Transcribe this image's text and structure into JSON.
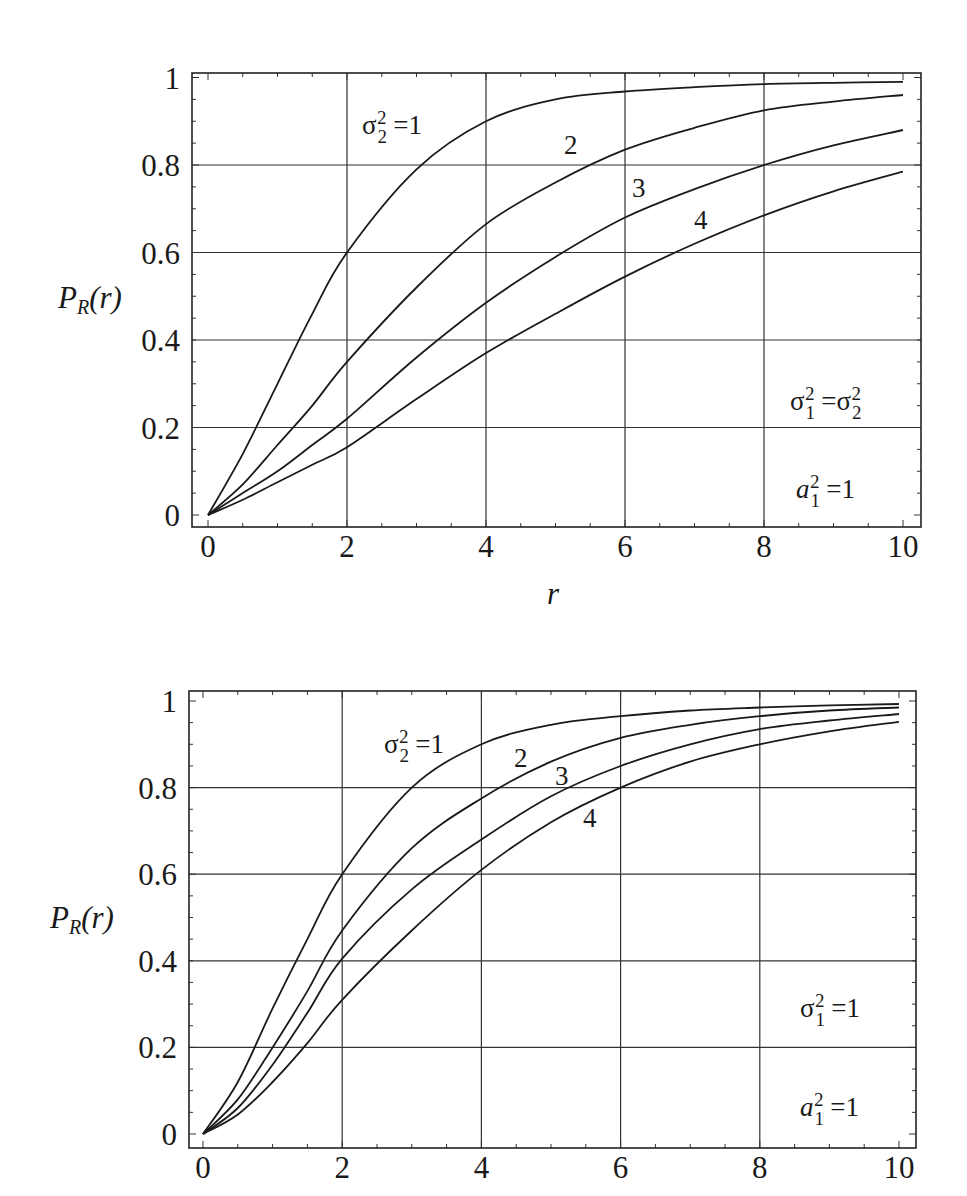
{
  "chart_data": [
    {
      "type": "line",
      "title": "",
      "xlabel": "r",
      "ylabel": "P_R(r)",
      "xlim": [
        0,
        10
      ],
      "ylim": [
        0,
        1
      ],
      "grid": true,
      "legend": "inline curve labels",
      "x_ticks": [
        "0",
        "2",
        "4",
        "6",
        "8",
        "10"
      ],
      "y_ticks": [
        "0",
        "0.2",
        "0.4",
        "0.6",
        "0.8",
        "1"
      ],
      "x": [
        0,
        0.5,
        1,
        1.5,
        2,
        3,
        4,
        5,
        6,
        7,
        8,
        9,
        10
      ],
      "series": [
        {
          "name": "σ2² = 1",
          "label": "σ₂² =1",
          "values": [
            0,
            0.14,
            0.3,
            0.46,
            0.6,
            0.79,
            0.9,
            0.95,
            0.968,
            0.978,
            0.985,
            0.988,
            0.99
          ]
        },
        {
          "name": "σ2² = 2",
          "label": "2",
          "values": [
            0,
            0.07,
            0.16,
            0.25,
            0.35,
            0.52,
            0.665,
            0.76,
            0.835,
            0.885,
            0.925,
            0.945,
            0.96
          ]
        },
        {
          "name": "σ2² = 3",
          "label": "3",
          "values": [
            0,
            0.05,
            0.1,
            0.16,
            0.22,
            0.36,
            0.485,
            0.59,
            0.68,
            0.745,
            0.8,
            0.845,
            0.88
          ]
        },
        {
          "name": "σ2² = 4",
          "label": "4",
          "values": [
            0,
            0.035,
            0.075,
            0.115,
            0.155,
            0.265,
            0.37,
            0.46,
            0.545,
            0.62,
            0.685,
            0.74,
            0.785
          ]
        }
      ],
      "annotations": [
        "σ₁² = σ₂²",
        "a₁² = 1"
      ]
    },
    {
      "type": "line",
      "title": "",
      "xlabel": "",
      "ylabel": "P_R(r)",
      "xlim": [
        0,
        10
      ],
      "ylim": [
        0,
        1
      ],
      "grid": true,
      "legend": "inline curve labels",
      "x_ticks": [
        "0",
        "2",
        "4",
        "6",
        "8",
        "10"
      ],
      "y_ticks": [
        "0",
        "0.2",
        "0.4",
        "0.6",
        "0.8",
        "1"
      ],
      "x": [
        0,
        0.5,
        1,
        1.5,
        2,
        3,
        4,
        5,
        6,
        7,
        8,
        9,
        10
      ],
      "series": [
        {
          "name": "σ2² = 1",
          "label": "σ₂² =1",
          "values": [
            0,
            0.12,
            0.29,
            0.45,
            0.6,
            0.8,
            0.9,
            0.945,
            0.965,
            0.978,
            0.985,
            0.99,
            0.993
          ]
        },
        {
          "name": "σ2² = 2",
          "label": "2",
          "values": [
            0,
            0.08,
            0.2,
            0.33,
            0.47,
            0.66,
            0.775,
            0.86,
            0.915,
            0.945,
            0.965,
            0.978,
            0.985
          ]
        },
        {
          "name": "σ2² = 3",
          "label": "3",
          "values": [
            0,
            0.06,
            0.16,
            0.28,
            0.405,
            0.565,
            0.68,
            0.78,
            0.85,
            0.9,
            0.935,
            0.955,
            0.97
          ]
        },
        {
          "name": "σ2² = 4",
          "label": "4",
          "values": [
            0,
            0.045,
            0.12,
            0.21,
            0.31,
            0.47,
            0.61,
            0.72,
            0.8,
            0.86,
            0.9,
            0.93,
            0.952
          ]
        }
      ],
      "annotations": [
        "σ₁² = 1",
        "a₁² = 1"
      ]
    }
  ],
  "charts": [
    {
      "ylabel_main": "P",
      "ylabel_sub": "R",
      "ylabel_rest": "(r)",
      "xlabel": "r",
      "curve_labels": {
        "first_sigma": "σ",
        "first_sub": "2",
        "first_sup": "2",
        "first_eq": " =1",
        "c2": "2",
        "c3": "3",
        "c4": "4"
      },
      "ann1": {
        "sym": "σ",
        "sub": "1",
        "sup": "2",
        "eq": " =σ",
        "sub2": "2",
        "sup2": "2"
      },
      "ann2": {
        "sym": "a",
        "sub": "1",
        "sup": "2",
        "eq": " =1"
      }
    },
    {
      "ylabel_main": "P",
      "ylabel_sub": "R",
      "ylabel_rest": "(r)",
      "xlabel": "",
      "curve_labels": {
        "first_sigma": "σ",
        "first_sub": "2",
        "first_sup": "2",
        "first_eq": " =1",
        "c2": "2",
        "c3": "3",
        "c4": "4"
      },
      "ann1": {
        "sym": "σ",
        "sub": "1",
        "sup": "2",
        "eq": " =1"
      },
      "ann2": {
        "sym": "a",
        "sub": "1",
        "sup": "2",
        "eq": " =1"
      }
    }
  ]
}
